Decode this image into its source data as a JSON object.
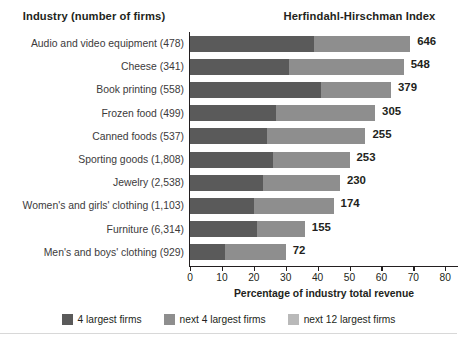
{
  "header": {
    "industry_title": "Industry (number of firms)",
    "hhi_title": "Herfindahl-Hirschman Index"
  },
  "axis": {
    "x_title": "Percentage of industry total revenue",
    "ticks": [
      "0",
      "10",
      "20",
      "30",
      "40",
      "50",
      "60",
      "70",
      "80"
    ]
  },
  "legend": {
    "items": [
      {
        "label": "4 largest firms",
        "color": "#5a5a5a",
        "swatch_name": "legend-swatch-top4"
      },
      {
        "label": "next 4 largest firms",
        "color": "#8e8e8e",
        "swatch_name": "legend-swatch-next4"
      },
      {
        "label": "next 12 largest firms",
        "color": "#b9b9b9",
        "swatch_name": "legend-swatch-next12"
      }
    ]
  },
  "colors": {
    "top4": "#5a5a5a",
    "next4": "#8e8e8e",
    "next12": "#b9b9b9",
    "text": "#231f20",
    "label_text": "#3c3a3b"
  },
  "chart_data": {
    "type": "bar",
    "orientation": "horizontal",
    "stacked": true,
    "title": "Herfindahl-Hirschman Index",
    "xlabel": "Percentage of industry total revenue",
    "ylabel": "Industry (number of firms)",
    "xlim": [
      0,
      84
    ],
    "grid": false,
    "legend_position": "bottom",
    "xticks": [
      0,
      10,
      20,
      30,
      40,
      50,
      60,
      70,
      80
    ],
    "categories": [
      "Audio and video equipment (478)",
      "Cheese (341)",
      "Book printing (558)",
      "Frozen food (499)",
      "Canned foods (537)",
      "Sporting goods (1,808)",
      "Jewelry (2,538)",
      "Women's and girls' clothing (1,103)",
      "Furniture (6,314)",
      "Men's and boys' clothing (929)"
    ],
    "series": [
      {
        "name": "4 largest firms",
        "color": "#5a5a5a",
        "values": [
          39,
          31,
          41,
          27,
          24,
          26,
          23,
          20,
          21,
          11
        ]
      },
      {
        "name": "next 4 largest firms",
        "color": "#8e8e8e",
        "values": [
          30,
          36,
          22,
          31,
          31,
          24,
          24,
          25,
          15,
          19
        ]
      },
      {
        "name": "next 12 largest firms",
        "color": "#b9b9b9",
        "values": [
          0,
          0,
          0,
          0,
          0,
          0,
          0,
          0,
          0,
          0
        ]
      }
    ],
    "annotations": {
      "name": "HHI",
      "values": [
        646,
        548,
        379,
        305,
        255,
        253,
        230,
        174,
        155,
        72
      ]
    }
  },
  "rows": [
    {
      "label": "Audio and video equipment (478)",
      "seg_a": 39,
      "seg_b": 30,
      "seg_c": 0,
      "value": "646"
    },
    {
      "label": "Cheese (341)",
      "seg_a": 31,
      "seg_b": 36,
      "seg_c": 0,
      "value": "548"
    },
    {
      "label": "Book printing (558)",
      "seg_a": 41,
      "seg_b": 22,
      "seg_c": 0,
      "value": "379"
    },
    {
      "label": "Frozen food (499)",
      "seg_a": 27,
      "seg_b": 31,
      "seg_c": 0,
      "value": "305"
    },
    {
      "label": "Canned foods (537)",
      "seg_a": 24,
      "seg_b": 31,
      "seg_c": 0,
      "value": "255"
    },
    {
      "label": "Sporting goods (1,808)",
      "seg_a": 26,
      "seg_b": 24,
      "seg_c": 0,
      "value": "253"
    },
    {
      "label": "Jewelry (2,538)",
      "seg_a": 23,
      "seg_b": 24,
      "seg_c": 0,
      "value": "230"
    },
    {
      "label": "Women's and girls' clothing (1,103)",
      "seg_a": 20,
      "seg_b": 25,
      "seg_c": 0,
      "value": "174"
    },
    {
      "label": "Furniture (6,314)",
      "seg_a": 21,
      "seg_b": 15,
      "seg_c": 0,
      "value": "155"
    },
    {
      "label": "Men's and boys' clothing (929)",
      "seg_a": 11,
      "seg_b": 19,
      "seg_c": 0,
      "value": "72"
    }
  ]
}
